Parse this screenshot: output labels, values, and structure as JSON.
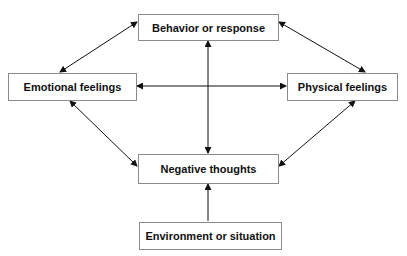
{
  "diagram": {
    "nodes": {
      "behavior": "Behavior or response",
      "emotional": "Emotional feelings",
      "physical": "Physical feelings",
      "negative": "Negative thoughts",
      "environment": "Environment or situation"
    },
    "edges": [
      {
        "from": "behavior",
        "to": "emotional",
        "type": "bidirectional"
      },
      {
        "from": "behavior",
        "to": "physical",
        "type": "bidirectional"
      },
      {
        "from": "behavior",
        "to": "negative",
        "type": "bidirectional"
      },
      {
        "from": "emotional",
        "to": "physical",
        "type": "bidirectional"
      },
      {
        "from": "emotional",
        "to": "negative",
        "type": "bidirectional"
      },
      {
        "from": "physical",
        "to": "negative",
        "type": "bidirectional"
      },
      {
        "from": "environment",
        "to": "negative",
        "type": "directed"
      }
    ],
    "colors": {
      "line": "#111111",
      "border": "#8a8a8a"
    }
  }
}
